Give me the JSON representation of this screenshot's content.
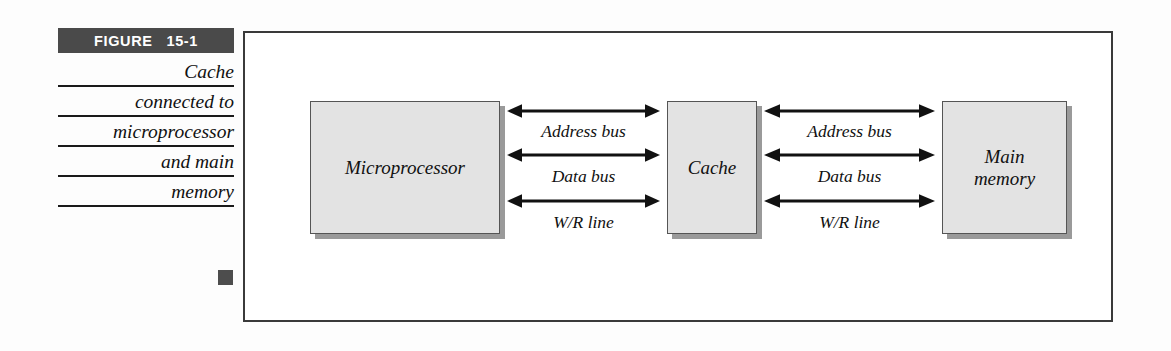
{
  "figure": {
    "badge_word": "FIGURE",
    "badge_number": "15-1",
    "caption_lines": [
      "Cache",
      "connected to",
      "microprocessor",
      "and main",
      "memory"
    ],
    "end_marker": "square-bullet"
  },
  "diagram": {
    "type": "block-diagram",
    "nodes": [
      {
        "id": "microprocessor",
        "label": "Microprocessor"
      },
      {
        "id": "cache",
        "label": "Cache"
      },
      {
        "id": "main-memory",
        "label": "Main\nmemory"
      }
    ],
    "connections": [
      {
        "id": "cpu-cache",
        "from": "microprocessor",
        "to": "cache",
        "buses": [
          {
            "label": "Address bus",
            "direction": "bidirectional"
          },
          {
            "label": "Data bus",
            "direction": "bidirectional"
          },
          {
            "label": "W/R line",
            "direction": "bidirectional"
          }
        ]
      },
      {
        "id": "cache-memory",
        "from": "cache",
        "to": "main-memory",
        "buses": [
          {
            "label": "Address bus",
            "direction": "bidirectional"
          },
          {
            "label": "Data bus",
            "direction": "bidirectional"
          },
          {
            "label": "W/R line",
            "direction": "bidirectional"
          }
        ]
      }
    ]
  },
  "colors": {
    "badge_background": "#4a4a4a",
    "badge_text": "#ffffff",
    "node_fill": "#e3e3e3",
    "node_border": "#555555",
    "node_shadow": "#9a9a9a",
    "frame_border": "#3a3a3a",
    "rule": "#1a1a1a",
    "end_marker": "#4d4d4d"
  }
}
